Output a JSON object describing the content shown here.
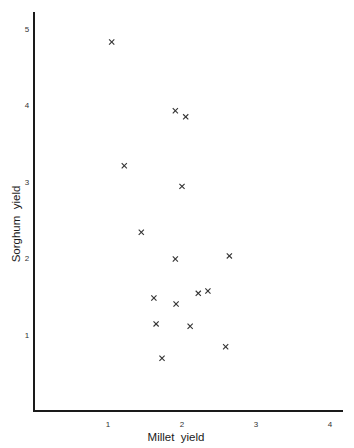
{
  "chart_data": {
    "type": "scatter",
    "title": "",
    "xlabel": "Millet  yield",
    "ylabel": "Sorghum  yield",
    "xlim": [
      0,
      4.15
    ],
    "ylim": [
      0,
      5.2
    ],
    "xticks": [
      1,
      2,
      3,
      4
    ],
    "yticks": [
      1,
      2,
      3,
      4,
      5
    ],
    "xtick_labels": [
      "1",
      "2",
      "3",
      "4"
    ],
    "ytick_labels": [
      "1",
      "2",
      "3",
      "4",
      "5"
    ],
    "grid": false,
    "legend": null,
    "marker": "x",
    "series": [
      {
        "name": "Millet vs Sorghum yield",
        "points": [
          {
            "x": 1.05,
            "y": 4.83
          },
          {
            "x": 1.91,
            "y": 3.93
          },
          {
            "x": 2.05,
            "y": 3.85
          },
          {
            "x": 1.22,
            "y": 3.21
          },
          {
            "x": 2.0,
            "y": 2.94
          },
          {
            "x": 1.45,
            "y": 2.34
          },
          {
            "x": 1.91,
            "y": 1.99
          },
          {
            "x": 2.64,
            "y": 2.03
          },
          {
            "x": 1.62,
            "y": 1.48
          },
          {
            "x": 2.22,
            "y": 1.54
          },
          {
            "x": 2.35,
            "y": 1.57
          },
          {
            "x": 1.92,
            "y": 1.4
          },
          {
            "x": 1.65,
            "y": 1.14
          },
          {
            "x": 2.11,
            "y": 1.11
          },
          {
            "x": 2.59,
            "y": 0.84
          },
          {
            "x": 1.73,
            "y": 0.69
          }
        ]
      }
    ]
  },
  "colors": {
    "axis": "#1a1a1a",
    "marker": "#333333",
    "text": "#222222",
    "background": "#ffffff"
  }
}
